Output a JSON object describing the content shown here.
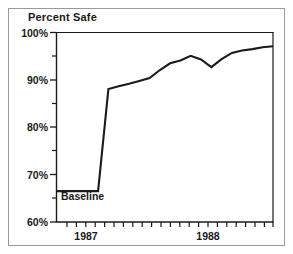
{
  "figure": {
    "title": "Percent Safe",
    "baseline_annotation": "Baseline",
    "frame_color": "#9a9a9a",
    "axis_color": "#1a1a1a",
    "line_color": "#1a1a1a",
    "background": "#ffffff"
  },
  "chart_data": {
    "type": "line",
    "title": "Percent Safe",
    "xlabel": "",
    "ylabel": "Percent Safe",
    "ylim": [
      60,
      100
    ],
    "yticks": [
      60,
      70,
      80,
      90,
      100
    ],
    "ytick_labels": [
      "60%",
      "70%",
      "80%",
      "90%",
      "100%"
    ],
    "yminor_ticks": [
      65,
      75,
      85,
      95
    ],
    "grid": false,
    "legend": null,
    "xtick_labels": [
      "1987",
      "1988"
    ],
    "xtick_label_positions": [
      3,
      15
    ],
    "xminor_tick_count": 23,
    "annotations": [
      {
        "text": "Baseline",
        "x_index": 1,
        "y": 66.5,
        "note": "labels the flat pre-intervention segment"
      }
    ],
    "x": [
      1,
      2,
      3,
      4,
      5,
      6,
      7,
      8,
      9,
      10,
      11,
      12,
      13,
      14,
      15,
      16,
      17,
      18,
      19,
      20,
      21,
      22
    ],
    "values": [
      66.5,
      66.5,
      66.5,
      66.5,
      66.5,
      88.0,
      88.6,
      89.1,
      89.7,
      90.3,
      92.0,
      93.4,
      94.0,
      95.0,
      94.2,
      92.6,
      94.3,
      95.6,
      96.1,
      96.4,
      96.8,
      97.0
    ],
    "series": [
      {
        "name": "Percent Safe",
        "values": [
          66.5,
          66.5,
          66.5,
          66.5,
          66.5,
          88.0,
          88.6,
          89.1,
          89.7,
          90.3,
          92.0,
          93.4,
          94.0,
          95.0,
          94.2,
          92.6,
          94.3,
          95.6,
          96.1,
          96.4,
          96.8,
          97.0
        ]
      }
    ]
  }
}
